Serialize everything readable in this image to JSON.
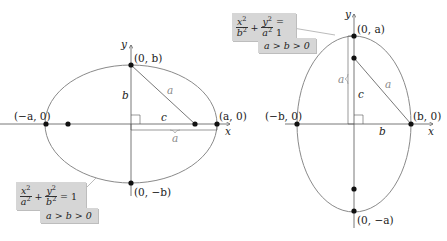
{
  "left_diagram": {
    "title": "Horizontal ellipse",
    "axis_labels": {
      "x": "x",
      "y": "y"
    },
    "points": {
      "top": "(0, b)",
      "bottom": "(0, −b)",
      "left": "(−a, 0)",
      "right": "(a, 0)"
    },
    "segment_labels": {
      "vertical": "b",
      "horizontal": "c",
      "hypotenuse": "a",
      "bracket": "a"
    },
    "equation": {
      "term1_num": "x",
      "term1_den": "a",
      "term2_num": "y",
      "term2_den": "b",
      "exp": "2",
      "plus": "+",
      "equals": "= 1"
    },
    "condition": "a > b > 0"
  },
  "right_diagram": {
    "title": "Vertical ellipse",
    "axis_labels": {
      "x": "x",
      "y": "y"
    },
    "points": {
      "top": "(0, a)",
      "bottom": "(0, −a)",
      "left": "(−b, 0)",
      "right": "(b, 0)"
    },
    "segment_labels": {
      "vertical": "c",
      "horizontal": "b",
      "hypotenuse": "a",
      "bracket": "a"
    },
    "equation": {
      "term1_num": "x",
      "term1_den": "b",
      "term2_num": "y",
      "term2_den": "a",
      "exp": "2",
      "plus": "+",
      "equals": "= 1"
    },
    "condition": "a > b > 0"
  },
  "colors": {
    "ellipse": "#8a8a8a",
    "axes": "#555555",
    "points": "#111111",
    "label_box": "#d6d6d6",
    "gray_label": "#8a8a8a"
  }
}
